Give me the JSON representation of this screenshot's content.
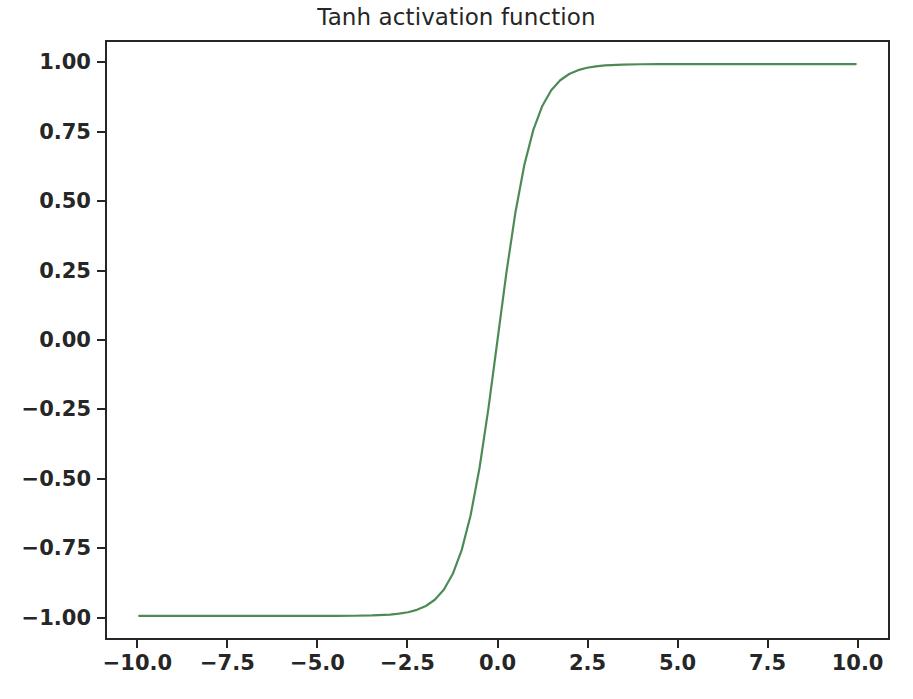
{
  "figure": {
    "width": 913,
    "height": 699,
    "background": "#ffffff"
  },
  "chart_data": {
    "type": "line",
    "title": "Tanh activation function",
    "xlabel": "",
    "ylabel": "",
    "xlim": [
      -10.6,
      -0.0
    ],
    "ylim": [
      -1.08,
      1.08
    ],
    "grid": false,
    "legend": null,
    "line_color": "#4d8b56",
    "line_width": 2.2,
    "axis_color": "#262626",
    "x_ticks": [
      -10.0,
      -7.5,
      -5.0,
      -2.5,
      0.0,
      2.5,
      5.0,
      7.5,
      10.0
    ],
    "x_tick_labels": [
      "−10.0",
      "−7.5",
      "−5.0",
      "−2.5",
      "0.0",
      "2.5",
      "5.0",
      "7.5",
      "10.0"
    ],
    "y_ticks": [
      1.0,
      0.75,
      0.5,
      0.25,
      0.0,
      -0.25,
      -0.5,
      -0.75,
      -1.0
    ],
    "y_tick_labels": [
      "1.00",
      "0.75",
      "0.50",
      "0.25",
      "0.00",
      "−0.25",
      "−0.50",
      "−0.75",
      "−1.00"
    ],
    "series": [
      {
        "name": "tanh(x)",
        "x": [
          -10.0,
          -9.5,
          -9.0,
          -8.5,
          -8.0,
          -7.5,
          -7.0,
          -6.5,
          -6.0,
          -5.5,
          -5.0,
          -4.5,
          -4.0,
          -3.5,
          -3.0,
          -2.75,
          -2.5,
          -2.25,
          -2.0,
          -1.75,
          -1.5,
          -1.25,
          -1.0,
          -0.75,
          -0.5,
          -0.25,
          0.0,
          0.25,
          0.5,
          0.75,
          1.0,
          1.25,
          1.5,
          1.75,
          2.0,
          2.25,
          2.5,
          2.75,
          3.0,
          3.5,
          4.0,
          4.5,
          5.0,
          5.5,
          6.0,
          6.5,
          7.0,
          7.5,
          8.0,
          8.5,
          9.0,
          9.5,
          10.0
        ],
        "y": [
          -1.0,
          -1.0,
          -1.0,
          -1.0,
          -1.0,
          -1.0,
          -0.999998,
          -0.999995,
          -0.999988,
          -0.999967,
          -0.999909,
          -0.999753,
          -0.999329,
          -0.998178,
          -0.995055,
          -0.991843,
          -0.986614,
          -0.978026,
          -0.964028,
          -0.941376,
          -0.905148,
          -0.848284,
          -0.761594,
          -0.635149,
          -0.462117,
          -0.244919,
          0.0,
          0.244919,
          0.462117,
          0.635149,
          0.761594,
          0.848284,
          0.905148,
          0.941376,
          0.964028,
          0.978026,
          0.986614,
          0.991843,
          0.995055,
          0.998178,
          0.999329,
          0.999753,
          0.999909,
          0.999967,
          0.999988,
          0.999995,
          0.999998,
          1.0,
          1.0,
          1.0,
          1.0,
          1.0,
          1.0
        ]
      }
    ]
  }
}
